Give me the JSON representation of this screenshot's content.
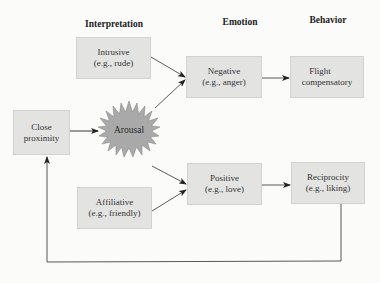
{
  "diagram": {
    "type": "flowchart",
    "columns": {
      "interpretation": "Interpretation",
      "emotion": "Emotion",
      "behavior": "Behavior"
    },
    "nodes": {
      "close_proximity": {
        "line1": "Close",
        "line2": "proximity"
      },
      "arousal": {
        "label": "Arousal",
        "shape": "starburst"
      },
      "intrusive": {
        "line1": "Intrusive",
        "line2": "(e.g., rude)"
      },
      "affiliative": {
        "line1": "Affiliative",
        "line2": "(e.g., friendly)"
      },
      "negative": {
        "line1": "Negative",
        "line2": "(e.g., anger)"
      },
      "positive": {
        "line1": "Positive",
        "line2": "(e.g., love)"
      },
      "flight": {
        "line1": "Flight",
        "line2": "compensatory"
      },
      "reciprocity": {
        "line1": "Reciprocity",
        "line2": "(e.g., liking)"
      }
    },
    "edges": [
      {
        "from": "close_proximity",
        "to": "arousal"
      },
      {
        "from": "intrusive",
        "to": "negative"
      },
      {
        "from": "arousal",
        "to": "negative"
      },
      {
        "from": "arousal",
        "to": "positive"
      },
      {
        "from": "affiliative",
        "to": "positive"
      },
      {
        "from": "negative",
        "to": "flight"
      },
      {
        "from": "positive",
        "to": "reciprocity"
      },
      {
        "from": "reciprocity",
        "to": "close_proximity",
        "style": "feedback-loop"
      }
    ],
    "colors": {
      "box_fill": "#e3e3e2",
      "box_border": "#d2d2d0",
      "starburst_fill": "#a9a9a9",
      "line": "#3a3a3a",
      "background": "#fbfbfa"
    }
  }
}
